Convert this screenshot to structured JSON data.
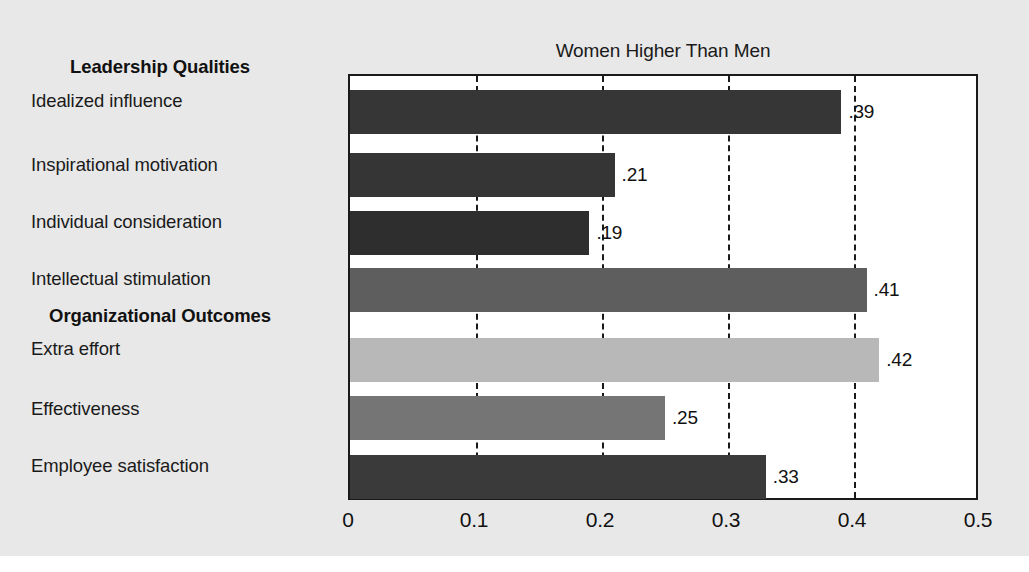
{
  "figure": {
    "width": 1029,
    "height": 572,
    "background_color": "#e8e8e8",
    "plot_background_color": "#ffffff",
    "frame_color": "#1a1a1a"
  },
  "chart_data": {
    "type": "bar",
    "orientation": "horizontal",
    "title": "Women Higher Than Men",
    "xlabel": "",
    "ylabel": "",
    "xlim": [
      0,
      0.5
    ],
    "xticks": [
      "0",
      "0.1",
      "0.2",
      "0.3",
      "0.4",
      "0.5"
    ],
    "xtick_values": [
      0,
      0.1,
      0.2,
      0.3,
      0.4,
      0.5
    ],
    "grid": "vertical-dashed",
    "legend": "none",
    "categories": [
      "Idealized influence",
      "Inspirational motivation",
      "Individual consideration",
      "Intellectual stimulation",
      "Extra effort",
      "Effectiveness",
      "Employee satisfaction"
    ],
    "values": [
      0.39,
      0.21,
      0.19,
      0.41,
      0.42,
      0.25,
      0.33
    ],
    "value_labels": [
      ".39",
      ".21",
      ".19",
      ".41",
      ".42",
      ".25",
      ".33"
    ],
    "bar_colors": [
      "#363636",
      "#353535",
      "#2e2e2e",
      "#5e5e5e",
      "#b8b8b8",
      "#757575",
      "#3a3a3a"
    ],
    "groups": [
      {
        "header": "Leadership Qualities",
        "categories": [
          "Idealized influence",
          "Inspirational motivation",
          "Individual consideration",
          "Intellectual stimulation"
        ]
      },
      {
        "header": "Organizational Outcomes",
        "categories": [
          "Extra effort",
          "Effectiveness",
          "Employee satisfaction"
        ]
      }
    ]
  },
  "section_headers": {
    "leadership": "Leadership Qualities",
    "organizational": "Organizational Outcomes"
  }
}
